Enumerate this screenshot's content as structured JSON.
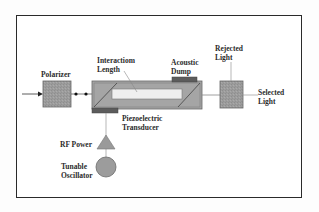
{
  "diagram": {
    "type": "block-diagram",
    "labels": {
      "polarizer": "Polarizer",
      "interaction_length_line1": "Interactiom",
      "interaction_length_line2": "Length",
      "acoustic_dump_line1": "Acoustic",
      "acoustic_dump_line2": "Dump",
      "rejected_light_line1": "Rejected",
      "rejected_light_line2": "Light",
      "selected_light_line1": "Selected",
      "selected_light_line2": "Light",
      "piezo_line1": "Piezoelectric",
      "piezo_line2": "Transducer",
      "rf_power": "RF Power",
      "oscillator_line1": "Tunable",
      "oscillator_line2": "Oscillator"
    },
    "nodes": [
      {
        "id": "input-beam",
        "shape": "arrow"
      },
      {
        "id": "polarizer",
        "shape": "box"
      },
      {
        "id": "aotf-crystal",
        "shape": "box-with-diagonals"
      },
      {
        "id": "acoustic-dump",
        "shape": "box"
      },
      {
        "id": "piezoelectric-transducer",
        "shape": "box"
      },
      {
        "id": "output-polarizer",
        "shape": "box"
      },
      {
        "id": "rf-power",
        "shape": "triangle"
      },
      {
        "id": "tunable-oscillator",
        "shape": "circle"
      }
    ],
    "edges": [
      {
        "from": "input-beam",
        "to": "polarizer"
      },
      {
        "from": "polarizer",
        "to": "aotf-crystal",
        "style": "dotted-beads"
      },
      {
        "from": "aotf-crystal",
        "to": "output-polarizer"
      },
      {
        "from": "output-polarizer",
        "to": "rejected-light",
        "direction": "up"
      },
      {
        "from": "output-polarizer",
        "to": "selected-light",
        "direction": "right"
      },
      {
        "from": "tunable-oscillator",
        "to": "rf-power"
      },
      {
        "from": "rf-power",
        "to": "piezoelectric-transducer"
      }
    ],
    "colors": {
      "frame": "#2a2a2a",
      "box_fill": "#9a9a9a",
      "box_stroke": "#555555",
      "crystal_fill": "#a3a3a3",
      "interaction_region": "#eeeeee",
      "dark_block": "#5c5c5c",
      "line": "#8a8a8a",
      "text": "#2b2b2b"
    }
  }
}
